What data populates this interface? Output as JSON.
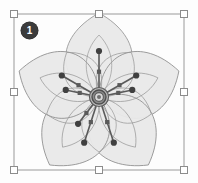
{
  "app": {
    "view_name": "vector-illustration-canvas",
    "canvas_background": "#fdfdfd"
  },
  "annotation": {
    "step_number": "1",
    "badge_color": "#3b3b3b",
    "badge_text_color": "#ffffff"
  },
  "selection": {
    "label": "selection-bounding-box",
    "border_color": "#9a9a9a",
    "handle_fill": "#ffffff",
    "handle_border": "#8c8c8c",
    "box": {
      "x": 14,
      "y": 14,
      "width": 170,
      "height": 156
    },
    "handles": [
      {
        "name": "handle-top-left",
        "x": 14,
        "y": 14
      },
      {
        "name": "handle-top-center",
        "x": 99,
        "y": 14
      },
      {
        "name": "handle-top-right",
        "x": 184,
        "y": 14
      },
      {
        "name": "handle-middle-left",
        "x": 14,
        "y": 92
      },
      {
        "name": "handle-middle-right",
        "x": 184,
        "y": 92
      },
      {
        "name": "handle-bottom-left",
        "x": 14,
        "y": 170
      },
      {
        "name": "handle-bottom-center",
        "x": 99,
        "y": 170
      },
      {
        "name": "handle-bottom-right",
        "x": 184,
        "y": 170
      }
    ]
  },
  "artwork": {
    "name": "five-petal-flower",
    "center": {
      "x": 99,
      "y": 97
    },
    "petal_fill": "#e9e9e9",
    "petal_stroke": "#8f8f8f",
    "inner_petal_stroke": "#9a9a9a",
    "stamen_color": "#5a5a5a",
    "stamen_tip_color": "#404040",
    "core_outer_color": "#5d5d5d",
    "core_mid_color": "#a8a8a8",
    "core_inner_color": "#6e6e6e",
    "petal_count": 5,
    "petal_angles": [
      0,
      72,
      144,
      216,
      288
    ],
    "stamen_count": 8,
    "stamens": [
      {
        "angle": -90,
        "length": 46,
        "node_at": 0.55
      },
      {
        "angle": -150,
        "length": 43,
        "node_at": 0.55
      },
      {
        "angle": -30,
        "length": 43,
        "node_at": 0.55
      },
      {
        "angle": -168,
        "length": 34,
        "node_at": 0.58
      },
      {
        "angle": -12,
        "length": 34,
        "node_at": 0.58
      },
      {
        "angle": 108,
        "length": 48,
        "node_at": 0.55
      },
      {
        "angle": 72,
        "length": 48,
        "node_at": 0.55
      },
      {
        "angle": 128,
        "length": 34,
        "node_at": 0.6
      }
    ]
  }
}
